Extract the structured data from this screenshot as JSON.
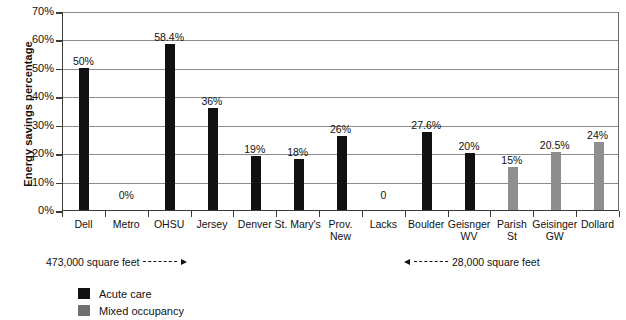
{
  "chart_data": {
    "type": "bar",
    "title": "",
    "xlabel": "",
    "ylabel": "Energy savings percentage",
    "ylim": [
      0,
      70
    ],
    "ytick_labels": [
      "0%",
      "10%",
      "20%",
      "30%",
      "40%",
      "50%",
      "60%",
      "70%"
    ],
    "ytick_values": [
      0,
      10,
      20,
      30,
      40,
      50,
      60,
      70
    ],
    "grid": true,
    "legend_position": "bottom-left",
    "categories": [
      "Dell",
      "Metro",
      "OHSU",
      "Jersey",
      "Denver",
      "St. Mary's",
      "Prov.\nNew",
      "Lacks",
      "Boulder",
      "Geisnger\nWV",
      "Parish\nSt",
      "Geisinger\nGW",
      "Dollard"
    ],
    "values": [
      50,
      0,
      58.4,
      36,
      19,
      18,
      26,
      0,
      27.6,
      20,
      15,
      20.5,
      24
    ],
    "value_labels": [
      "50%",
      "0%",
      "58.4%",
      "36%",
      "19%",
      "18%",
      "26%",
      "0",
      "27.6%",
      "20%",
      "15%",
      "20.5%",
      "24%"
    ],
    "series_of_bar": [
      "acute",
      "acute",
      "acute",
      "acute",
      "acute",
      "acute",
      "acute",
      "acute",
      "acute",
      "acute",
      "mixed",
      "mixed",
      "mixed"
    ],
    "legend": [
      {
        "key": "acute",
        "label": "Acute care",
        "color": "#111111"
      },
      {
        "key": "mixed",
        "label": "Mixed occupancy",
        "color": "#6f6f6f"
      }
    ],
    "annotations": [
      {
        "key": "left",
        "text": "473,000 square feet",
        "direction": "right"
      },
      {
        "key": "right",
        "text": "28,000 square feet",
        "direction": "left"
      }
    ]
  }
}
